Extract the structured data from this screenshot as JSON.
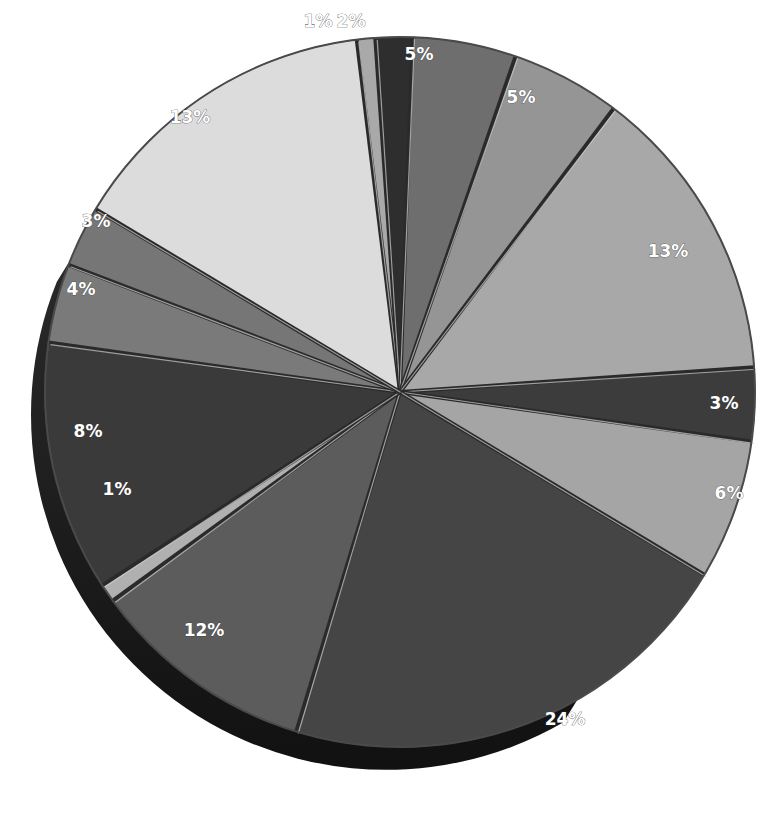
{
  "chart_data": {
    "type": "pie",
    "title": "",
    "style": "3d-exploded-grayscale",
    "labels_format": "percent",
    "legend": "none",
    "slices": [
      {
        "label": "1%",
        "value": 1,
        "color": "#a9a9a9",
        "start": -7,
        "end": -4
      },
      {
        "label": "2%",
        "value": 2,
        "color": "#2e2e2e",
        "start": -4,
        "end": 2
      },
      {
        "label": "5%",
        "value": 5,
        "color": "#6e6e6e",
        "start": 2,
        "end": 19
      },
      {
        "label": "5%",
        "value": 5,
        "color": "#959595",
        "start": 19,
        "end": 37
      },
      {
        "label": "13%",
        "value": 13,
        "color": "#a8a8a8",
        "start": 37,
        "end": 86
      },
      {
        "label": "3%",
        "value": 3,
        "color": "#3c3c3c",
        "start": 86,
        "end": 98
      },
      {
        "label": "6%",
        "value": 6,
        "color": "#a5a5a5",
        "start": 98,
        "end": 121
      },
      {
        "label": "24%",
        "value": 24,
        "color": "#454545",
        "start": 121,
        "end": 197
      },
      {
        "label": "12%",
        "value": 12,
        "color": "#5c5c5c",
        "start": 197,
        "end": 234
      },
      {
        "label": "1%",
        "value": 1,
        "color": "#b0b0b0",
        "start": 234,
        "end": 237
      },
      {
        "label": "8%",
        "value": 8,
        "color": "#3a3a3a",
        "start": 237,
        "end": 278
      },
      {
        "label": "4%",
        "value": 4,
        "color": "#7a7a7a",
        "start": 278,
        "end": 291
      },
      {
        "label": "3%",
        "value": 3,
        "color": "#767676",
        "start": 291,
        "end": 301
      },
      {
        "label": "13%",
        "value": 13,
        "color": "#dcdcdc",
        "start": 301,
        "end": 353
      }
    ],
    "label_positions": [
      {
        "x": 318,
        "y": 22
      },
      {
        "x": 351,
        "y": 22
      },
      {
        "x": 419,
        "y": 55
      },
      {
        "x": 521,
        "y": 98
      },
      {
        "x": 668,
        "y": 252
      },
      {
        "x": 724,
        "y": 404
      },
      {
        "x": 729,
        "y": 494
      },
      {
        "x": 565,
        "y": 720
      },
      {
        "x": 204,
        "y": 631
      },
      {
        "x": 117,
        "y": 490
      },
      {
        "x": 88,
        "y": 432
      },
      {
        "x": 81,
        "y": 290
      },
      {
        "x": 96,
        "y": 222
      },
      {
        "x": 190,
        "y": 118
      }
    ]
  },
  "geometry": {
    "cx": 400,
    "cy": 392,
    "r": 355,
    "depth": 38
  }
}
